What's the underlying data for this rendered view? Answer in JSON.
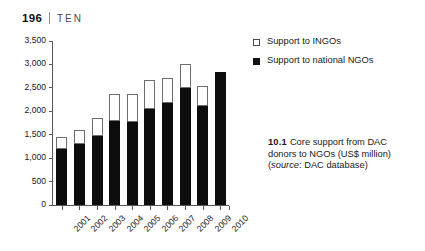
{
  "running_head": {
    "folio": "196",
    "separator": "|",
    "chapter": "TEN"
  },
  "legend": {
    "items": [
      {
        "label": "Support to INGOs",
        "marker": "hollow-square",
        "color": "#ffffff"
      },
      {
        "label": "Support to national NGOs",
        "marker": "solid-square",
        "color": "#111111"
      }
    ]
  },
  "caption": {
    "number": "10.1",
    "text": "Core support from DAC donors to NGOs (US$ million)",
    "source_open": "(",
    "source_label": "source",
    "source_value": ": DAC database)"
  },
  "chart_data": {
    "type": "bar",
    "stacked": true,
    "title": "Core support from DAC donors to NGOs (US$ million)",
    "xlabel": "",
    "ylabel": "",
    "ylim": [
      0,
      3500
    ],
    "yticks": [
      0,
      500,
      1000,
      1500,
      2000,
      2500,
      3000,
      3500
    ],
    "ytick_labels": [
      "0",
      "500",
      "1,000",
      "1,500",
      "2,000",
      "2,500",
      "3,000",
      "3,500"
    ],
    "grid": false,
    "legend_position": "top-right-outside",
    "categories": [
      "2001",
      "2002",
      "2003",
      "2004",
      "2005",
      "2006",
      "2007",
      "2008",
      "2009",
      "2010"
    ],
    "series": [
      {
        "name": "Support to national NGOs",
        "color": "#111111",
        "values": [
          1200,
          1300,
          1480,
          1790,
          1780,
          2040,
          2180,
          2500,
          2110,
          2830
        ]
      },
      {
        "name": "Support to INGOs",
        "color": "#ffffff",
        "values": [
          250,
          310,
          370,
          580,
          590,
          630,
          530,
          500,
          420,
          0
        ]
      }
    ],
    "totals": [
      1450,
      1610,
      1850,
      2370,
      2370,
      2670,
      2710,
      3000,
      2530,
      2830
    ]
  }
}
